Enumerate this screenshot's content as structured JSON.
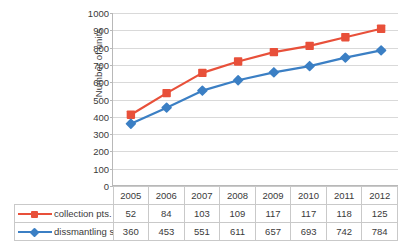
{
  "chart_data": {
    "type": "line",
    "title": "",
    "xlabel": "",
    "ylabel": "Number of units",
    "categories": [
      "2005",
      "2006",
      "2007",
      "2008",
      "2009",
      "2010",
      "2011",
      "2012"
    ],
    "ylim": [
      0,
      1000
    ],
    "ytick_step": 100,
    "yticks": [
      "1000",
      "900",
      "800",
      "700",
      "600",
      "500",
      "400",
      "300",
      "200",
      "100",
      "0"
    ],
    "grid": true,
    "legend_position": "table-left-column",
    "series": [
      {
        "name": "collection pts.",
        "color": "#E8503A",
        "marker": "square",
        "values": [
          52,
          84,
          103,
          109,
          117,
          117,
          118,
          125
        ],
        "plotted_values": [
          412,
          537,
          654,
          720,
          774,
          810,
          860,
          909
        ],
        "plotted_as": "cumulative total (collection pts. + dissmantling st.)"
      },
      {
        "name": "dissmantling st.",
        "color": "#3B7FC4",
        "marker": "diamond",
        "values": [
          360,
          453,
          551,
          611,
          657,
          693,
          742,
          784
        ],
        "plotted_values": [
          360,
          453,
          551,
          611,
          657,
          693,
          742,
          784
        ],
        "plotted_as": "value"
      }
    ]
  },
  "table": {
    "header_row": [
      "2005",
      "2006",
      "2007",
      "2008",
      "2009",
      "2010",
      "2011",
      "2012"
    ],
    "rows": [
      {
        "label": "collection pts.",
        "marker_color": "#E8503A",
        "marker_shape": "square",
        "values": [
          "52",
          "84",
          "103",
          "109",
          "117",
          "117",
          "118",
          "125"
        ]
      },
      {
        "label": "dissmantling st.",
        "marker_color": "#3B7FC4",
        "marker_shape": "diamond",
        "values": [
          "360",
          "453",
          "551",
          "611",
          "657",
          "693",
          "742",
          "784"
        ]
      }
    ]
  },
  "colors": {
    "series_red": "#E8503A",
    "series_blue": "#3B7FC4",
    "gridline": "#d9d9d9",
    "axis": "#b8b8b8",
    "table_border": "#c9c9c9",
    "text": "#3a3a3a",
    "background": "#ffffff"
  }
}
